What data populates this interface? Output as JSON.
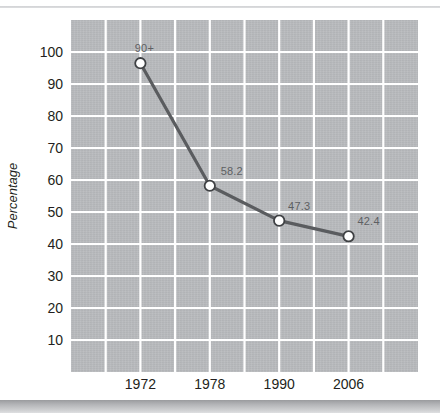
{
  "figure": {
    "background_color": "#ffffff",
    "panel_color": "#b9bbbe",
    "gridline_color": "#ffffff",
    "line_color": "#5a5c5f",
    "marker_fill": "#ffffff",
    "marker_edge": "#3f4144",
    "annotation_color": "#5d5f62",
    "axis_text_color": "#231f20"
  },
  "chart_data": {
    "type": "line",
    "title": "",
    "subtitle": "",
    "xlabel": "",
    "ylabel": "Percentage",
    "categories": [
      "1972",
      "1978",
      "1990",
      "2006"
    ],
    "x": [
      1972,
      1978,
      1990,
      2006
    ],
    "values": [
      96.5,
      58.2,
      47.3,
      42.4
    ],
    "point_labels": [
      "90+",
      "58.2",
      "47.3",
      "42.4"
    ],
    "ylim": [
      0,
      110
    ],
    "ytick_labels": [
      "100",
      "90",
      "80",
      "70",
      "60",
      "50",
      "40",
      "30",
      "20",
      "10"
    ],
    "ytick_values": [
      100,
      90,
      80,
      70,
      60,
      50,
      40,
      30,
      20,
      10
    ],
    "xtick_labels": [
      "1972",
      "1978",
      "1990",
      "2006"
    ],
    "grid": "both",
    "vertical_gridline_count": 10,
    "horizontal_gridline_count": 11,
    "legend": "none",
    "legend_position": "none",
    "series": [
      {
        "name": "Percentage",
        "values": [
          96.5,
          58.2,
          47.3,
          42.4
        ],
        "labels": [
          "90+",
          "58.2",
          "47.3",
          "42.4"
        ]
      }
    ]
  }
}
